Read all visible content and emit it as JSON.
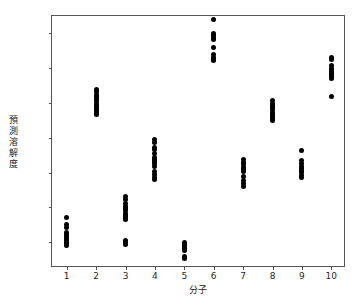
{
  "chart_data": {
    "type": "scatter",
    "title": "",
    "xlabel": "分子",
    "ylabel": "預測溶解度",
    "xlim": [
      0.5,
      10.5
    ],
    "ylim": [
      -1.87,
      1.75
    ],
    "grid": false,
    "legend": "none",
    "marker_color": "#000000",
    "marker_size": 5,
    "xticks": [
      1,
      2,
      3,
      4,
      5,
      6,
      7,
      8,
      9,
      10
    ],
    "xtick_labels": [
      "1",
      "2",
      "3",
      "4",
      "5",
      "6",
      "7",
      "8",
      "9",
      "10"
    ],
    "yticks": [
      -1.5,
      -1.0,
      -0.5,
      0.0,
      0.5,
      1.0,
      1.5
    ],
    "ytick_labels": [
      "-1.5",
      "-1.0",
      "-0.5",
      "0.0",
      "0.5",
      "1.0",
      "1.5"
    ],
    "groups": [
      {
        "x": 1,
        "label": "1",
        "values": [
          -1.14,
          -1.25,
          -1.29,
          -1.36,
          -1.39,
          -1.42,
          -1.45,
          -1.47,
          -1.5,
          -1.52,
          -1.55
        ]
      },
      {
        "x": 2,
        "label": "2",
        "values": [
          0.69,
          0.66,
          0.62,
          0.59,
          0.56,
          0.53,
          0.5,
          0.47,
          0.44,
          0.41,
          0.38,
          0.35,
          0.33
        ]
      },
      {
        "x": 3,
        "label": "3",
        "values": [
          -0.85,
          -0.89,
          -0.95,
          -0.99,
          -1.02,
          -1.05,
          -1.08,
          -1.11,
          -1.14,
          -1.17,
          -1.47,
          -1.5,
          -1.53
        ]
      },
      {
        "x": 4,
        "label": "4",
        "values": [
          -0.03,
          -0.07,
          -0.14,
          -0.17,
          -0.23,
          -0.28,
          -0.31,
          -0.34,
          -0.37,
          -0.41,
          -0.48,
          -0.53,
          -0.57,
          -0.6
        ]
      },
      {
        "x": 5,
        "label": "5",
        "values": [
          -1.5,
          -1.53,
          -1.56,
          -1.59,
          -1.62,
          -1.7,
          -1.74
        ]
      },
      {
        "x": 6,
        "label": "6",
        "values": [
          1.7,
          1.5,
          1.47,
          1.44,
          1.41,
          1.3,
          1.19,
          1.16,
          1.13,
          1.11
        ]
      },
      {
        "x": 7,
        "label": "7",
        "values": [
          -0.31,
          -0.35,
          -0.39,
          -0.42,
          -0.45,
          -0.49,
          -0.56,
          -0.62,
          -0.66,
          -0.7
        ]
      },
      {
        "x": 8,
        "label": "8",
        "values": [
          0.54,
          0.5,
          0.46,
          0.43,
          0.4,
          0.37,
          0.34,
          0.31,
          0.28,
          0.25
        ]
      },
      {
        "x": 9,
        "label": "9",
        "values": [
          -0.18,
          -0.33,
          -0.37,
          -0.41,
          -0.44,
          -0.47,
          -0.5,
          -0.54,
          -0.57
        ]
      },
      {
        "x": 10,
        "label": "10",
        "values": [
          1.15,
          1.12,
          1.04,
          1.0,
          0.97,
          0.94,
          0.91,
          0.88,
          0.85,
          0.59
        ]
      }
    ]
  }
}
